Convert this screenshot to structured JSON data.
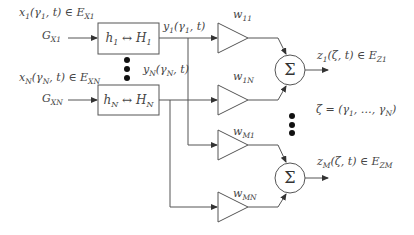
{
  "diagram": {
    "inputs": [
      {
        "signal_label": "x1(γ1, t) ∈ EX1",
        "signal_main": "x",
        "signal_sub": "1",
        "signal_rest": "(γ",
        "signal_sub2": "1",
        "signal_tail": ", t) ∈ E",
        "signal_set_sub": "X1",
        "prior_main": "G",
        "prior_sub": "X1"
      },
      {
        "signal_label": "xN(γN, t) ∈ EXN",
        "signal_main": "x",
        "signal_sub": "N",
        "signal_rest": "(γ",
        "signal_sub2": "N",
        "signal_tail": ", t) ∈ E",
        "signal_set_sub": "XN",
        "prior_main": "G",
        "prior_sub": "XN"
      }
    ],
    "blocks": [
      {
        "label": "h1 ↔ H1",
        "h": "h",
        "h_sub": "1",
        "arrow": " ↔ ",
        "H": "H",
        "H_sub": "1"
      },
      {
        "label": "hN ↔ HN",
        "h": "h",
        "h_sub": "N",
        "arrow": " ↔ ",
        "H": "H",
        "H_sub": "N"
      }
    ],
    "block_outputs": [
      {
        "label": "y1(γ1, t)",
        "main": "y",
        "sub": "1",
        "rest": "(γ",
        "sub2": "1",
        "tail": ", t)"
      },
      {
        "label": "yN(γN, t)",
        "main": "y",
        "sub": "N",
        "rest": "(γ",
        "sub2": "N",
        "tail": ", t)"
      }
    ],
    "weights": [
      {
        "label": "w11",
        "main": "w",
        "sub": "11"
      },
      {
        "label": "w1N",
        "main": "w",
        "sub": "1N"
      },
      {
        "label": "wM1",
        "main": "w",
        "sub": "M1"
      },
      {
        "label": "wMN",
        "main": "w",
        "sub": "MN"
      }
    ],
    "summers": [
      {
        "symbol": "Σ"
      },
      {
        "symbol": "Σ"
      }
    ],
    "outputs": [
      {
        "label": "z1(ζ, t) ∈ EZ1",
        "main": "z",
        "sub": "1",
        "rest": "(ζ, t) ∈ E",
        "set_sub": "Z1"
      },
      {
        "label": "zM(ζ, t) ∈ EZM",
        "main": "z",
        "sub": "M",
        "rest": "(ζ, t) ∈ E",
        "set_sub": "ZM"
      }
    ],
    "zeta_definition": "ζ = (γ1, …, γN)",
    "zeta_parts": {
      "lhs": "ζ = (γ",
      "s1": "1",
      "mid": ", …, γ",
      "s2": "N",
      "end": ")"
    },
    "colors": {
      "stroke": "#555555",
      "text": "#444444",
      "dots": "#111111"
    }
  }
}
